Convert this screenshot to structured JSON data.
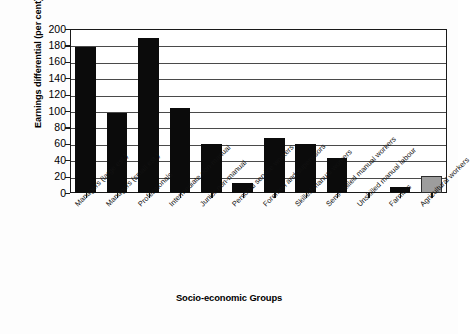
{
  "chart_data": {
    "type": "bar",
    "title": "",
    "xlabel": "Socio-economic Groups",
    "ylabel": "Earnings differential (per cent)",
    "ylim": [
      0,
      200
    ],
    "ytick_step": 20,
    "yticks": [
      200,
      180,
      160,
      140,
      120,
      100,
      80,
      60,
      40,
      20,
      0
    ],
    "grid": true,
    "legend": "none",
    "categories": [
      "Managers (large est.)",
      "Managers (small est.)",
      "Professionals",
      "Intermediate non-manual",
      "Junior non-manual",
      "Personal service workers",
      "Foremen and supervisors",
      "Skilled manual workers",
      "Semi-skilled manual workers",
      "Unskilled manual labour",
      "Farmers",
      "Agricultural workers"
    ],
    "values": [
      178,
      98,
      189,
      104,
      60,
      12,
      67,
      60,
      43,
      0,
      7,
      21
    ],
    "bar_colors": [
      "#0b0b0b",
      "#0b0b0b",
      "#0b0b0b",
      "#0b0b0b",
      "#0b0b0b",
      "#0b0b0b",
      "#0b0b0b",
      "#0b0b0b",
      "#0b0b0b",
      "#0b0b0b",
      "#0b0b0b",
      "#9d9d9d"
    ]
  },
  "colors": {
    "bar_black": "#0b0b0b",
    "bar_gray": "#9d9d9d",
    "axis": "#1a1a1a",
    "grid": "#4a4a4a",
    "background": "#ffffff"
  }
}
